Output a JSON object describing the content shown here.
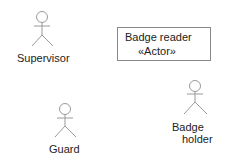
{
  "diagram": {
    "type": "uml-actors",
    "stroke_color": "#9a9a9a",
    "text_color": "#222222",
    "actors": [
      {
        "id": "supervisor",
        "label": "Supervisor"
      },
      {
        "id": "guard",
        "label": "Guard"
      },
      {
        "id": "badge-holder",
        "label_line1": "Badge",
        "label_line2": "holder"
      }
    ],
    "classifier_box": {
      "name": "Badge reader",
      "stereotype": "«Actor»"
    }
  }
}
